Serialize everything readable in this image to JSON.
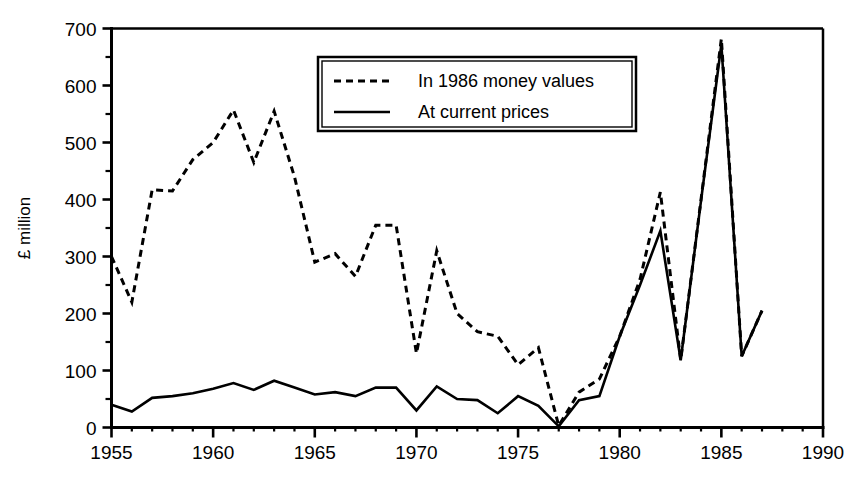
{
  "chart_data": {
    "type": "line",
    "title": "",
    "subtitle": "",
    "xlabel": "",
    "ylabel": "£ million",
    "xlim": [
      1955,
      1990
    ],
    "ylim": [
      0,
      700
    ],
    "x_ticks": [
      1955,
      1960,
      1965,
      1970,
      1975,
      1980,
      1985,
      1990
    ],
    "x_tick_labels": [
      "1955",
      "1960",
      "1965",
      "1970",
      "1975",
      "1980",
      "1985",
      "1990"
    ],
    "x_minor_step": 1,
    "y_ticks": [
      0,
      100,
      200,
      300,
      400,
      500,
      600,
      700
    ],
    "y_tick_labels": [
      "0",
      "100",
      "200",
      "300",
      "400",
      "500",
      "600",
      "700"
    ],
    "y_minor_step": 50,
    "grid": false,
    "legend_position": "top-center",
    "x": [
      1955,
      1956,
      1957,
      1958,
      1959,
      1960,
      1961,
      1962,
      1963,
      1964,
      1965,
      1966,
      1967,
      1968,
      1969,
      1970,
      1971,
      1972,
      1973,
      1974,
      1975,
      1976,
      1977,
      1978,
      1979,
      1980,
      1981,
      1982,
      1983,
      1984,
      1985,
      1986,
      1987
    ],
    "series": [
      {
        "name": "In 1986 money values",
        "style": "dashed",
        "color": "#000000",
        "values": [
          300,
          220,
          417,
          415,
          470,
          500,
          557,
          465,
          555,
          440,
          290,
          305,
          265,
          355,
          355,
          130,
          310,
          200,
          168,
          160,
          110,
          140,
          3,
          62,
          85,
          160,
          260,
          413,
          118,
          400,
          682,
          125,
          205
        ]
      },
      {
        "name": "At current prices",
        "style": "solid",
        "color": "#000000",
        "values": [
          40,
          28,
          52,
          55,
          60,
          68,
          78,
          66,
          82,
          70,
          58,
          62,
          55,
          70,
          70,
          30,
          72,
          50,
          48,
          25,
          55,
          38,
          2,
          48,
          55,
          160,
          250,
          345,
          118,
          398,
          672,
          125,
          205
        ]
      }
    ]
  },
  "legend": {
    "entries": [
      {
        "label": "In 1986 money values",
        "style": "dashed"
      },
      {
        "label": "At current prices",
        "style": "solid"
      }
    ]
  }
}
